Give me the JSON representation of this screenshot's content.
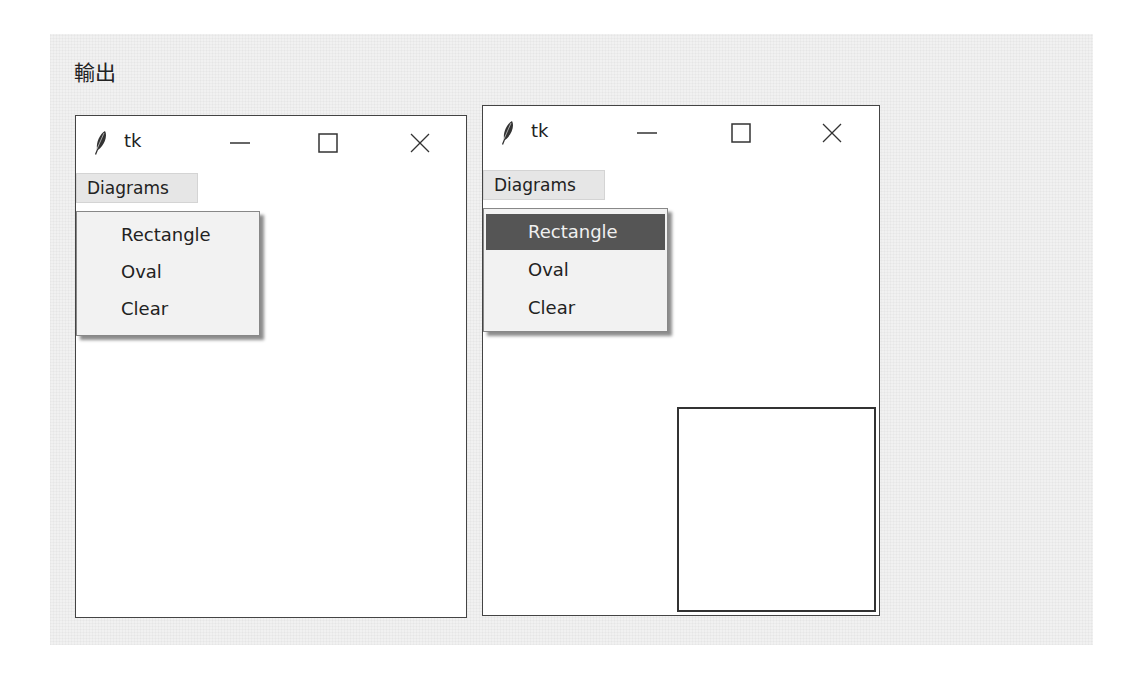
{
  "caption": "輸出",
  "windows": [
    {
      "title": "tk",
      "menu_label": "Diagrams",
      "menu_items": [
        {
          "label": "Rectangle",
          "active": false
        },
        {
          "label": "Oval",
          "active": false
        },
        {
          "label": "Clear",
          "active": false
        }
      ],
      "drawn_shape": null
    },
    {
      "title": "tk",
      "menu_label": "Diagrams",
      "menu_items": [
        {
          "label": "Rectangle",
          "active": true
        },
        {
          "label": "Oval",
          "active": false
        },
        {
          "label": "Clear",
          "active": false
        }
      ],
      "drawn_shape": "rectangle"
    }
  ],
  "icons": {
    "app": "feather-icon",
    "minimize": "minimize-icon",
    "maximize": "maximize-icon",
    "close": "close-icon"
  },
  "colors": {
    "highlight": "#555555",
    "panel": "#f1f1f1",
    "border": "#444444"
  }
}
